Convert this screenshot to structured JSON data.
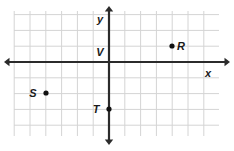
{
  "figure": {
    "type": "coordinate-plane",
    "background_color": "#ffffff",
    "grid_color": "#d4d4d4",
    "axis_color": "#2b2b2b",
    "point_color": "#111111",
    "label_color": "#1a1a1a"
  },
  "chart_data": {
    "type": "scatter",
    "title": "",
    "xlabel": "x",
    "ylabel": "y",
    "grid": true,
    "legend": null,
    "xlim": [
      -6,
      7
    ],
    "ylim": [
      -5,
      3
    ],
    "x_tick_labels": [],
    "y_tick_labels": [],
    "cell_size_px": 15.8,
    "origin_px": {
      "x": 109,
      "y": 62
    },
    "points": [
      {
        "name": "R",
        "x": 4,
        "y": 1,
        "label": "R",
        "label_side": "right",
        "px": {
          "x": 172,
          "y": 46
        }
      },
      {
        "name": "S",
        "x": -4,
        "y": -2,
        "label": "S",
        "label_side": "left",
        "px": {
          "x": 46,
          "y": 93
        }
      },
      {
        "name": "T",
        "x": 0,
        "y": -3,
        "label": "T",
        "label_side": "left",
        "px": {
          "x": 109,
          "y": 109
        }
      },
      {
        "name": "V",
        "x": 0,
        "y": 0,
        "label": "V",
        "label_side": "left",
        "px": {
          "x": 109,
          "y": 62
        }
      }
    ],
    "annotations": [
      {
        "text": "y",
        "px": {
          "x": 100,
          "y": 23
        }
      },
      {
        "text": "x",
        "px": {
          "x": 208,
          "y": 77
        }
      },
      {
        "text": "V",
        "px": {
          "x": 100,
          "y": 56
        }
      },
      {
        "text": "R",
        "px": {
          "x": 181,
          "y": 50
        }
      },
      {
        "text": "S",
        "px": {
          "x": 33,
          "y": 97
        }
      },
      {
        "text": "T",
        "px": {
          "x": 96,
          "y": 113
        }
      }
    ],
    "grid_extent_px": {
      "left": 14,
      "right": 219,
      "top": 11,
      "bottom": 136
    },
    "axis_extent_px": {
      "x_start": 4,
      "x_end": 230,
      "y_start": 6,
      "y_end": 145
    }
  }
}
